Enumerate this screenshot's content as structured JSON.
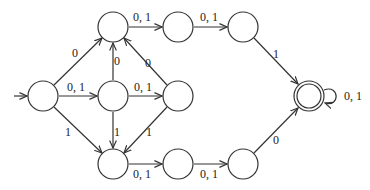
{
  "diagram": {
    "type": "finite-automaton",
    "colors": {
      "stroke": "#333333",
      "background": "#ffffff",
      "text": "#222222"
    },
    "start_state": "q0",
    "accept_states": [
      "qf"
    ],
    "states": [
      {
        "id": "q0",
        "x": 43,
        "y": 96
      },
      {
        "id": "q1",
        "x": 113,
        "y": 27
      },
      {
        "id": "q2",
        "x": 113,
        "y": 96
      },
      {
        "id": "q3",
        "x": 113,
        "y": 164
      },
      {
        "id": "q4",
        "x": 178,
        "y": 27
      },
      {
        "id": "q5",
        "x": 178,
        "y": 96
      },
      {
        "id": "q6",
        "x": 178,
        "y": 164
      },
      {
        "id": "q7",
        "x": 243,
        "y": 27
      },
      {
        "id": "q8",
        "x": 243,
        "y": 164
      },
      {
        "id": "qf",
        "x": 309,
        "y": 96
      }
    ],
    "transitions": [
      {
        "from": "q0",
        "to": "q1",
        "label": "0"
      },
      {
        "from": "q0",
        "to": "q2",
        "label": "0, 1"
      },
      {
        "from": "q0",
        "to": "q3",
        "label": "1"
      },
      {
        "from": "q2",
        "to": "q1",
        "label": "0"
      },
      {
        "from": "q2",
        "to": "q5",
        "label": "0, 1"
      },
      {
        "from": "q2",
        "to": "q3",
        "label": "1"
      },
      {
        "from": "q5",
        "to": "q1",
        "label": "0"
      },
      {
        "from": "q5",
        "to": "q3",
        "label": "1"
      },
      {
        "from": "q1",
        "to": "q4",
        "label": "0, 1"
      },
      {
        "from": "q4",
        "to": "q7",
        "label": "0, 1"
      },
      {
        "from": "q7",
        "to": "qf",
        "label": "1"
      },
      {
        "from": "q3",
        "to": "q6",
        "label": "0, 1"
      },
      {
        "from": "q6",
        "to": "q8",
        "label": "0, 1"
      },
      {
        "from": "q8",
        "to": "qf",
        "label": "0"
      },
      {
        "from": "qf",
        "to": "qf",
        "label": "0, 1"
      }
    ]
  },
  "labels": {
    "q0_q1": "0",
    "q0_q2": "0, 1",
    "q0_q3": "1",
    "q2_q1": "0",
    "q2_q5": "0, 1",
    "q2_q3": "1",
    "q5_q1": "0",
    "q5_q3": "1",
    "q1_q4": "0, 1",
    "q4_q7": "0, 1",
    "q7_qf": "1",
    "q3_q6": "0, 1",
    "q6_q8": "0, 1",
    "q8_qf": "0",
    "qf_qf": "0, 1"
  }
}
